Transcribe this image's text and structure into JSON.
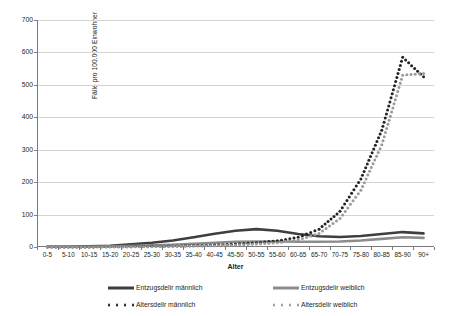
{
  "chart_data": {
    "type": "line",
    "title": "",
    "xlabel": "Alter",
    "ylabel": "Fälle pro 100.000 Einwohner",
    "ylim": [
      0,
      700
    ],
    "ytick_step": 100,
    "yticks": [
      "0",
      "100",
      "200",
      "300",
      "400",
      "500",
      "600",
      "700"
    ],
    "grid": "horizontal",
    "legend_position": "bottom",
    "categories": [
      "0-5",
      "5-10",
      "10-15",
      "15-20",
      "20-25",
      "25-30",
      "30-35",
      "35-40",
      "40-45",
      "45-50",
      "50-55",
      "55-60",
      "60-65",
      "65-70",
      "70-75",
      "75-80",
      "80-85",
      "85-90",
      "90+"
    ],
    "series": [
      {
        "name": "Entzugsdelir männlich",
        "style": "solid",
        "color": "#3f3f3f",
        "values": [
          1,
          1,
          2,
          4,
          8,
          13,
          20,
          30,
          41,
          50,
          55,
          50,
          40,
          33,
          31,
          34,
          40,
          46,
          42
        ]
      },
      {
        "name": "Entzugsdelir weiblich",
        "style": "solid",
        "color": "#8c8c8c",
        "values": [
          1,
          1,
          1,
          2,
          3,
          5,
          7,
          10,
          13,
          16,
          17,
          17,
          16,
          16,
          17,
          20,
          25,
          30,
          28
        ]
      },
      {
        "name": "Altersdelir männlich",
        "style": "dotted",
        "color": "#222222",
        "values": [
          0,
          0,
          0,
          1,
          1,
          2,
          3,
          4,
          6,
          9,
          13,
          19,
          30,
          55,
          110,
          210,
          360,
          585,
          525
        ]
      },
      {
        "name": "Altersdelir weiblich",
        "style": "dotted",
        "color": "#9a9a9a",
        "values": [
          0,
          0,
          0,
          1,
          1,
          1,
          2,
          3,
          4,
          6,
          9,
          13,
          22,
          42,
          88,
          175,
          315,
          530,
          535
        ]
      }
    ]
  },
  "legend": {
    "items": [
      {
        "label": "Entzugsdelir männlich",
        "style": "solid",
        "color": "#3f3f3f"
      },
      {
        "label": "Entzugsdelir weiblich",
        "style": "solid",
        "color": "#8c8c8c"
      },
      {
        "label": "Altersdelir männlich",
        "style": "dotted",
        "color": "#222222"
      },
      {
        "label": "Altersdelir weiblich",
        "style": "dotted",
        "color": "#9a9a9a"
      }
    ]
  },
  "colors": {
    "grid": "#d4d4d4",
    "axis": "#7a7a7a",
    "text": "#231f20",
    "background": "#ffffff"
  }
}
